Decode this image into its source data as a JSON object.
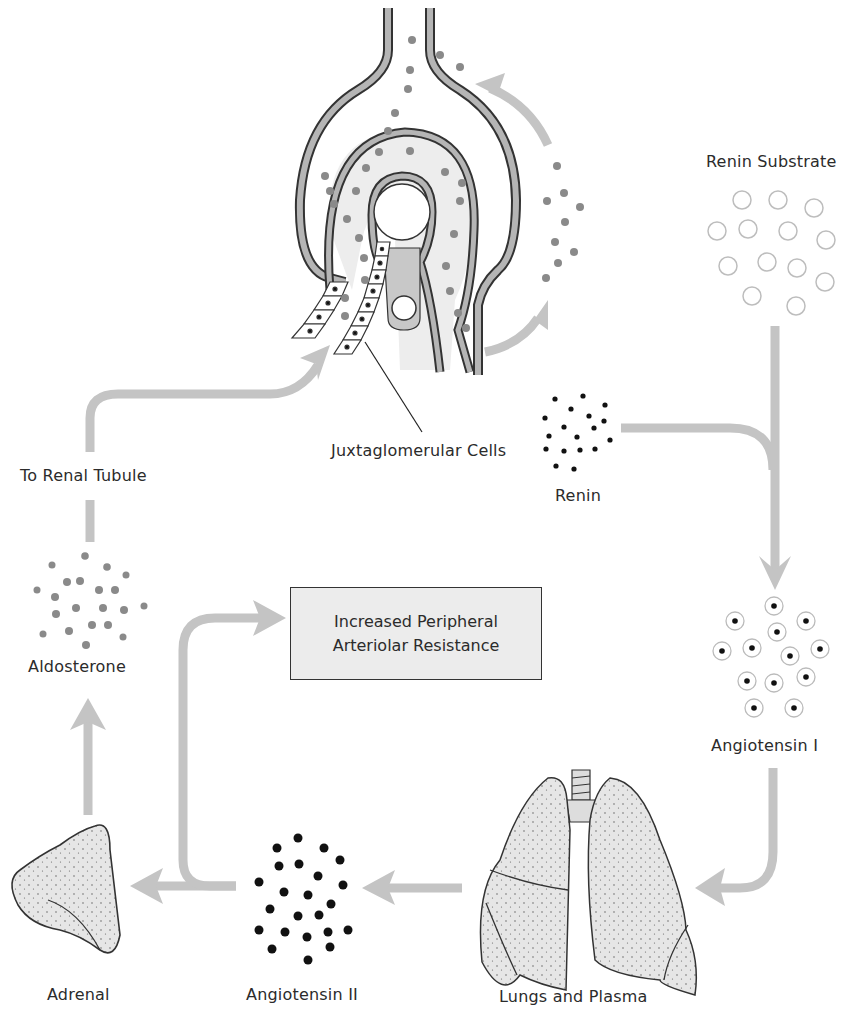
{
  "labels": {
    "renin_substrate": "Renin Substrate",
    "juxtaglomerular_cells": "Juxtaglomerular Cells",
    "renin": "Renin",
    "to_renal_tubule": "To Renal Tubule",
    "aldosterone": "Aldosterone",
    "angiotensin_i": "Angiotensin I",
    "angiotensin_ii": "Angiotensin II",
    "adrenal": "Adrenal",
    "lungs_and_plasma": "Lungs and Plasma"
  },
  "effect_box": {
    "line1": "Increased Peripheral",
    "line2": "Arteriolar Resistance"
  },
  "colors": {
    "arrow": "#c4c4c4",
    "granule": "#808080",
    "tissue_fill": "#e4e4e4",
    "outline": "#333333",
    "dot_dark": "#111111"
  },
  "flow": [
    "Juxtaglomerular Cells",
    "Renin",
    "Renin Substrate",
    "Angiotensin I",
    "Lungs and Plasma",
    "Angiotensin II",
    "Adrenal",
    "Aldosterone",
    "To Renal Tubule",
    "Increased Peripheral Arteriolar Resistance"
  ]
}
